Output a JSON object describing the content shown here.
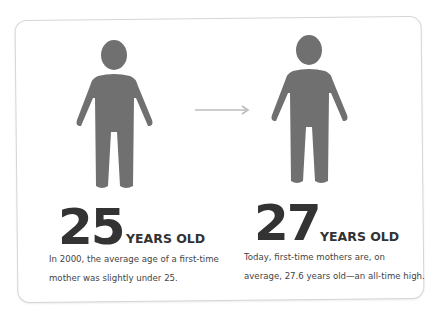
{
  "infographic": {
    "colors": {
      "figure": "#707070",
      "arrow": "#bdbdbd",
      "text_dark": "#333333",
      "text_body": "#444444",
      "card_border": "#d6d6d6"
    },
    "left": {
      "icon": "person-icon",
      "number": "25",
      "unit": "YEARS OLD",
      "description_line1": "In 2000, the average age of a first-time",
      "description_line2": "mother was slightly under 25."
    },
    "connector": {
      "icon": "arrow-right-icon"
    },
    "right": {
      "icon": "person-icon",
      "number": "27",
      "unit": "YEARS OLD",
      "description_line1": "Today, first-time mothers are, on",
      "description_line2": "average, 27.6 years old—an all-time high."
    }
  }
}
